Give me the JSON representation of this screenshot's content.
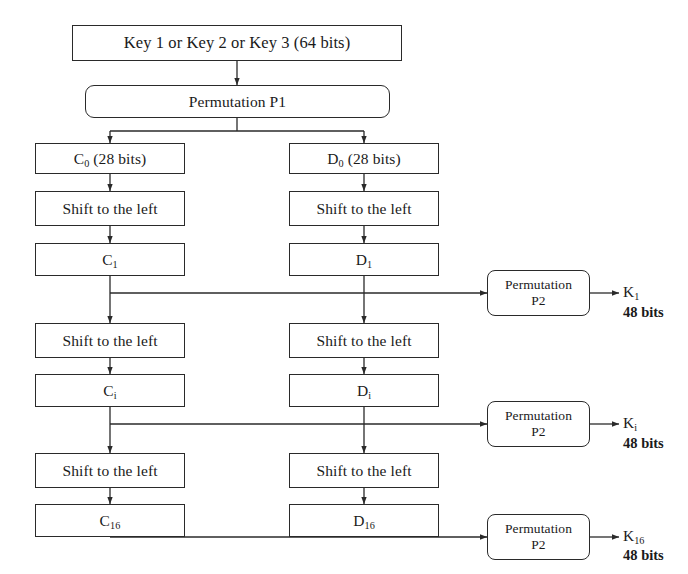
{
  "diagram": {
    "colors": {
      "background": "#ffffff",
      "stroke": "#2a2a2a",
      "text": "#1a1a1a"
    },
    "key_box": {
      "label": "Key 1 or Key 2 or Key 3 (64 bits)"
    },
    "permutation_p1": {
      "label": "Permutation P1"
    },
    "registers": {
      "c0": {
        "base": "C",
        "sub": "0",
        "suffix": " (28 bits)"
      },
      "d0": {
        "base": "D",
        "sub": "0",
        "suffix": " (28 bits)"
      },
      "c1": {
        "base": "C",
        "sub": "1",
        "suffix": ""
      },
      "d1": {
        "base": "D",
        "sub": "1",
        "suffix": ""
      },
      "ci": {
        "base": "C",
        "sub": "i",
        "suffix": ""
      },
      "di": {
        "base": "D",
        "sub": "i",
        "suffix": ""
      },
      "c16": {
        "base": "C",
        "sub": "16",
        "suffix": ""
      },
      "d16": {
        "base": "D",
        "sub": "16",
        "suffix": ""
      }
    },
    "shift": {
      "label": "Shift to the left"
    },
    "permutation_p2": {
      "line1": "Permutation",
      "line2": "P2"
    },
    "outputs": [
      {
        "base": "K",
        "sub": "1",
        "bits": "48 bits"
      },
      {
        "base": "K",
        "sub": "i",
        "bits": "48 bits"
      },
      {
        "base": "K",
        "sub": "16",
        "bits": "48 bits"
      }
    ]
  }
}
